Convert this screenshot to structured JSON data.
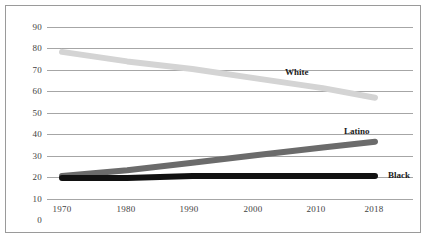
{
  "chart_data": {
    "type": "line",
    "title": "",
    "subtitle": "",
    "xlabel": "",
    "ylabel": "",
    "x": [
      1970,
      1980,
      1990,
      2000,
      2010,
      2018
    ],
    "xlim": [
      1966,
      2022
    ],
    "ylim": [
      0,
      95
    ],
    "yticks": [
      0,
      10,
      20,
      30,
      40,
      50,
      60,
      70,
      80,
      90
    ],
    "ytick_labels": [
      "0",
      "10",
      "20",
      "30",
      "40",
      "50",
      "60",
      "70",
      "80",
      "90"
    ],
    "xtick_labels": [
      "1970",
      "1980",
      "1990",
      "2000",
      "2010",
      "2018"
    ],
    "grid": true,
    "legend_position": "inline-end-of-line",
    "series": [
      {
        "name": "White",
        "label": "White",
        "color": "#d4d4d4",
        "values": [
          77,
          72,
          68,
          63,
          58,
          53
        ]
      },
      {
        "name": "Latino",
        "label": "Latino",
        "color": "#6b6b6b",
        "values": [
          12,
          15,
          19,
          23,
          27,
          30
        ]
      },
      {
        "name": "Black",
        "label": "Black",
        "color": "#111111",
        "values": [
          11,
          11,
          12,
          12,
          12,
          12
        ]
      }
    ]
  },
  "axis": {
    "y_labels": [
      "90",
      "80",
      "70",
      "60",
      "50",
      "40",
      "30",
      "20",
      "10",
      "0"
    ],
    "x_labels": [
      "1970",
      "1980",
      "1990",
      "2000",
      "2010",
      "2018"
    ]
  },
  "series_labels": {
    "white": "White",
    "latino": "Latino",
    "black": "Black"
  },
  "colors": {
    "white_line": "#d4d4d4",
    "latino_line": "#6b6b6b",
    "black_line": "#111111",
    "gridline": "#a6a6a6",
    "frame_border": "#9a9a9a",
    "tick_text": "#3f3f3f",
    "label_text": "#1a1a1a",
    "background": "#ffffff"
  }
}
